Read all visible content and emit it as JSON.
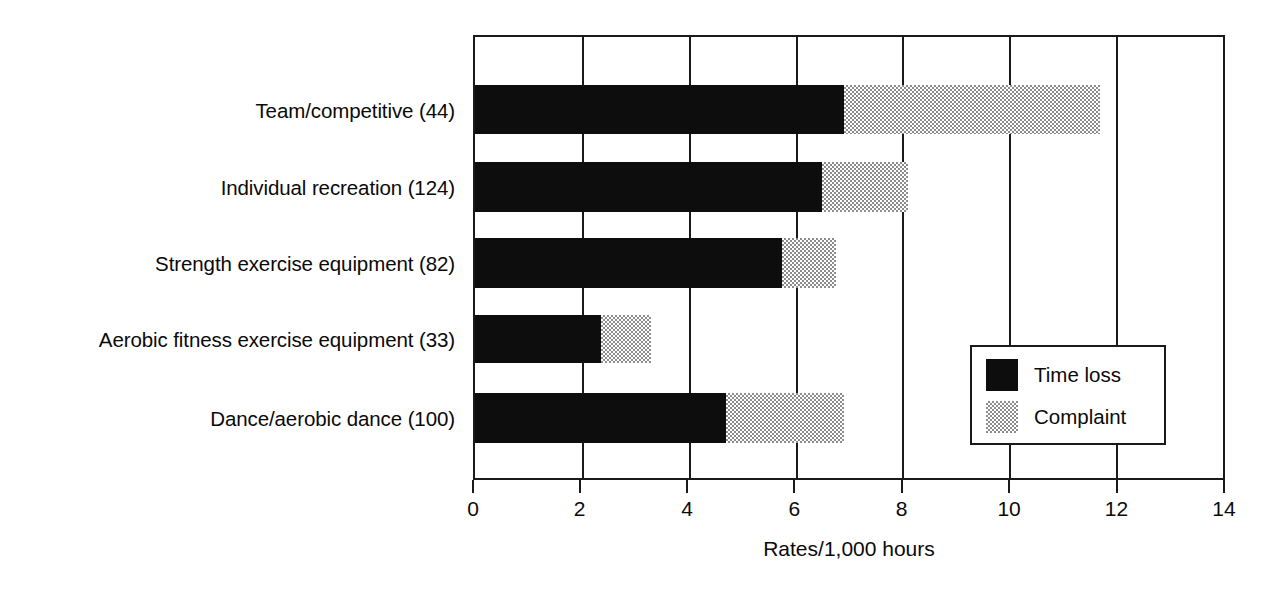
{
  "chart_data": {
    "type": "bar",
    "orientation": "horizontal",
    "stacked": true,
    "title": "",
    "xlabel": "Rates/1,000 hours",
    "ylabel": "",
    "xlim": [
      0,
      14
    ],
    "xticks": [
      0,
      2,
      4,
      6,
      8,
      10,
      12,
      14
    ],
    "xtick_labels": [
      "0",
      "2",
      "4",
      "6",
      "8",
      "10",
      "12",
      "14"
    ],
    "grid": true,
    "grid_axis": "x",
    "legend_position": "inner-lower-right",
    "categories": [
      "Team/competitive (44)",
      "Individual recreation (124)",
      "Strength exercise equipment (82)",
      "Aerobic fitness exercise equipment (33)",
      "Dance/aerobic dance (100)"
    ],
    "series": [
      {
        "name": "Time loss",
        "color": "#0d0d0d",
        "fill": "solid-black",
        "values": [
          6.9,
          6.5,
          5.75,
          2.35,
          4.7
        ]
      },
      {
        "name": "Complaint",
        "color": "#8c8c8c",
        "fill": "dotted-gray",
        "values": [
          4.8,
          1.6,
          1.0,
          0.95,
          2.2
        ]
      }
    ],
    "totals": [
      11.7,
      8.1,
      6.75,
      3.3,
      6.9
    ]
  },
  "legend": {
    "entries": [
      {
        "label": "Time loss",
        "swatch": "solid-black"
      },
      {
        "label": "Complaint",
        "swatch": "dotted-gray"
      }
    ]
  },
  "axis": {
    "x_title": "Rates/1,000 hours",
    "ticks": [
      "0",
      "2",
      "4",
      "6",
      "8",
      "10",
      "12",
      "14"
    ]
  },
  "colors": {
    "time_loss": "#0d0d0d",
    "complaint": "#8c8c8c",
    "axis": "#1a1a1a",
    "background": "#ffffff"
  }
}
